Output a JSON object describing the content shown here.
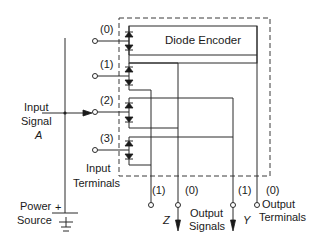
{
  "diagram": {
    "title": "Diode Encoder",
    "input_signal": {
      "line1": "Input",
      "line2": "Signal",
      "name": "A"
    },
    "input_terminals": {
      "line1": "Input",
      "line2": "Terminals",
      "labels": [
        "(0)",
        "(1)",
        "(2)",
        "(3)"
      ]
    },
    "output_terminals": {
      "line1": "Output",
      "line2": "Terminals",
      "labels": [
        "(1)",
        "(0)",
        "(1)",
        "(0)"
      ]
    },
    "output_signals": {
      "line1": "Output",
      "line2": "Signals",
      "z": "Z",
      "y": "Y"
    },
    "power_source": {
      "line1": "Power",
      "line2": "Source",
      "plus": "+"
    },
    "colors": {
      "line": "#2a2a2a",
      "background": "#ffffff"
    }
  }
}
